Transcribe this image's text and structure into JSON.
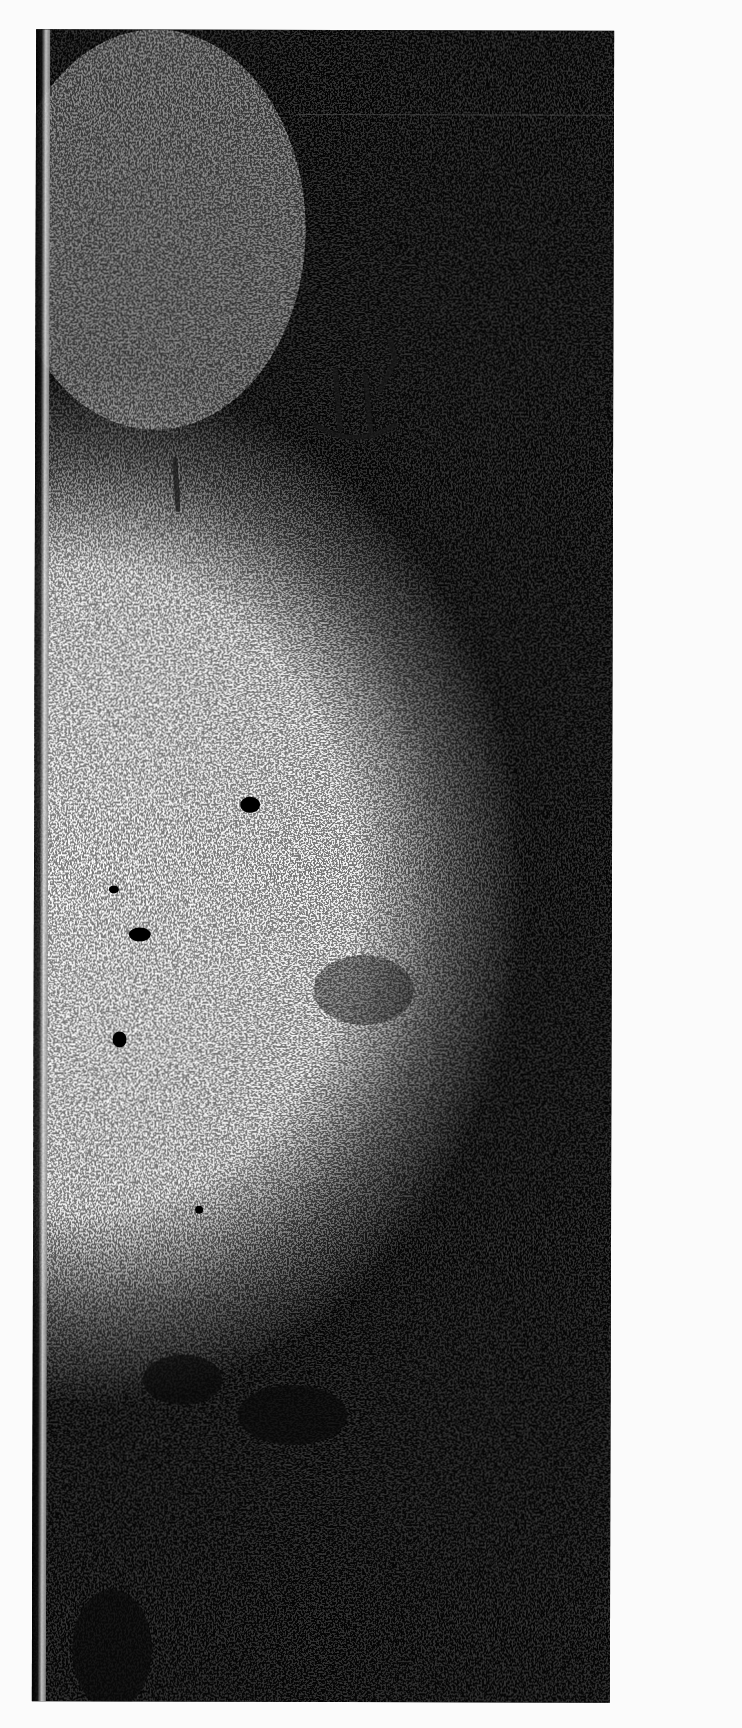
{
  "image": {
    "description": "Scanned grayscale photograph of a weathered stone surface with speckled texture",
    "frame": {
      "left": 34,
      "top": 30,
      "width": 578,
      "height": 1672
    },
    "colors": {
      "background": "#fbfbfb",
      "dark": "#050505",
      "light_speckle": "#e8e8e8",
      "mid_gray": "#8a8a8a"
    },
    "features": [
      {
        "name": "incised-marks",
        "x": 330,
        "y": 340,
        "w": 80,
        "h": 90
      },
      {
        "name": "dark-spot",
        "x": 250,
        "y": 805
      },
      {
        "name": "dark-spot",
        "x": 140,
        "y": 935
      },
      {
        "name": "dark-spot",
        "x": 120,
        "y": 1040
      },
      {
        "name": "dark-patch",
        "x": 180,
        "y": 1370
      },
      {
        "name": "dark-patch",
        "x": 290,
        "y": 1420
      }
    ]
  }
}
